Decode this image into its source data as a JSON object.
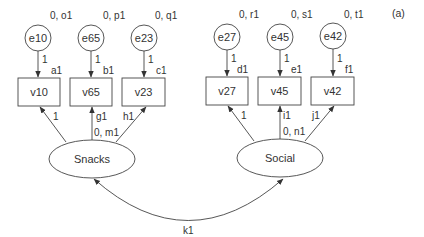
{
  "panel_label": "(a)",
  "error_terms": [
    {
      "id": "e10",
      "label": "e10",
      "params": "0, o1",
      "path": "1",
      "cx": 38,
      "cy": 38
    },
    {
      "id": "e65",
      "label": "e65",
      "params": "0, p1",
      "path": "1",
      "cx": 91,
      "cy": 38
    },
    {
      "id": "e23",
      "label": "e23",
      "params": "0, q1",
      "path": "1",
      "cx": 144,
      "cy": 38
    },
    {
      "id": "e27",
      "label": "e27",
      "params": "0, r1",
      "path": "1",
      "cx": 227,
      "cy": 37
    },
    {
      "id": "e45",
      "label": "e45",
      "params": "0, s1",
      "path": "1",
      "cx": 280,
      "cy": 37
    },
    {
      "id": "e42",
      "label": "e42",
      "params": "0, t1",
      "path": "1",
      "cx": 333,
      "cy": 36
    }
  ],
  "observed": [
    {
      "id": "v10",
      "label": "v10",
      "intercept": "a1",
      "x": 18,
      "y": 78
    },
    {
      "id": "v65",
      "label": "v65",
      "intercept": "b1",
      "x": 70,
      "y": 78
    },
    {
      "id": "v23",
      "label": "v23",
      "intercept": "c1",
      "x": 122,
      "y": 78
    },
    {
      "id": "v27",
      "label": "v27",
      "intercept": "d1",
      "x": 206,
      "y": 77
    },
    {
      "id": "v45",
      "label": "v45",
      "intercept": "e1",
      "x": 258,
      "y": 77
    },
    {
      "id": "v42",
      "label": "v42",
      "intercept": "f1",
      "x": 311,
      "y": 77
    }
  ],
  "latent": [
    {
      "id": "snacks",
      "label": "Snacks",
      "params": "0, m1",
      "cx": 92,
      "cy": 159,
      "loadings": [
        "1",
        "g1",
        "h1"
      ]
    },
    {
      "id": "social",
      "label": "Social",
      "params": "0, n1",
      "cx": 280,
      "cy": 158,
      "loadings": [
        "1",
        "i1",
        "j1"
      ]
    }
  ],
  "covariance": {
    "label": "k1",
    "from": "Snacks",
    "to": "Social"
  }
}
